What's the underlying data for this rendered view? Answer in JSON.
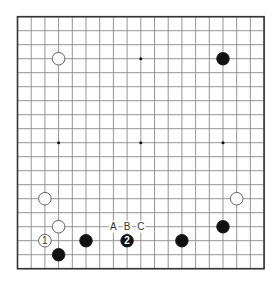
{
  "diagram": {
    "type": "go-board",
    "size": 19,
    "geometry": {
      "origin_x": 17.5,
      "origin_y": 16.7,
      "step_x": 13.7,
      "step_y": 14.0,
      "stone_radius": 6.3
    },
    "colors": {
      "background": "#ffffff",
      "grid": "#8a8a8a",
      "border": "#333333",
      "black_stone": "#111111",
      "white_stone": "#ffffff"
    },
    "star_points": [
      {
        "col": 3,
        "row": 3
      },
      {
        "col": 9,
        "row": 3
      },
      {
        "col": 15,
        "row": 3
      },
      {
        "col": 3,
        "row": 9
      },
      {
        "col": 9,
        "row": 9
      },
      {
        "col": 15,
        "row": 9
      },
      {
        "col": 3,
        "row": 15
      },
      {
        "col": 9,
        "row": 15
      },
      {
        "col": 15,
        "row": 15
      }
    ],
    "stones": [
      {
        "color": "white",
        "col": 3,
        "row": 3,
        "label": ""
      },
      {
        "color": "black",
        "col": 15,
        "row": 3,
        "label": ""
      },
      {
        "color": "white",
        "col": 2,
        "row": 13,
        "label": ""
      },
      {
        "color": "white",
        "col": 3,
        "row": 15,
        "label": ""
      },
      {
        "color": "white",
        "col": 2,
        "row": 16,
        "label": "1"
      },
      {
        "color": "black",
        "col": 3,
        "row": 17,
        "label": ""
      },
      {
        "color": "black",
        "col": 5,
        "row": 16,
        "label": ""
      },
      {
        "color": "black",
        "col": 8,
        "row": 16,
        "label": "2"
      },
      {
        "color": "black",
        "col": 12,
        "row": 16,
        "label": ""
      },
      {
        "color": "black",
        "col": 15,
        "row": 15,
        "label": ""
      },
      {
        "color": "white",
        "col": 16,
        "row": 13,
        "label": ""
      }
    ],
    "marks": [
      {
        "col": 7,
        "row": 15,
        "label": "A"
      },
      {
        "col": 8,
        "row": 15,
        "label": "B"
      },
      {
        "col": 9,
        "row": 15,
        "label": "C"
      }
    ]
  }
}
